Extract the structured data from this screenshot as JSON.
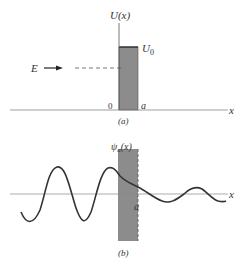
{
  "panel_a": {
    "y_label": "U(x)",
    "barrier_label": "U",
    "barrier_subscript": "0",
    "energy_label": "E",
    "origin_label": "0",
    "width_label": "a",
    "x_label": "x",
    "caption": "(a)"
  },
  "panel_b": {
    "y_label": "ψ",
    "y_label_subscript": "a",
    "y_label_suffix": "(x)",
    "width_label": "a",
    "x_label": "x",
    "caption": "(b)"
  },
  "colors": {
    "barrier_fill": "#8c8c8c",
    "line": "#444444",
    "axis": "#888888"
  }
}
